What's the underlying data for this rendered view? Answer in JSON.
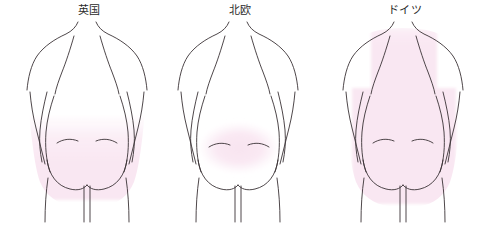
{
  "illustration": {
    "title_alt": "",
    "view": "back-view-torso",
    "background_color": "#ffffff",
    "outline_color": "#3a3236",
    "highlight_color": "#f9e7f2",
    "highlight_color_soft": "#fbeef6",
    "label_color": "#2b2b2b",
    "figures": [
      {
        "id": "uk",
        "label": "英国",
        "label_x": 89,
        "label_y": 14,
        "highlight_region": "lower-back-and-buttocks",
        "highlight_name": "lumbar-gluteal-band"
      },
      {
        "id": "nordic",
        "label": "北欧",
        "label_x": 240,
        "label_y": 14,
        "highlight_region": "sacral-oval",
        "highlight_name": "sacral-patch"
      },
      {
        "id": "germany",
        "label": "ドイツ",
        "label_x": 405,
        "label_y": 14,
        "highlight_region": "whole-back-and-buttocks",
        "highlight_name": "full-back-band"
      }
    ]
  }
}
